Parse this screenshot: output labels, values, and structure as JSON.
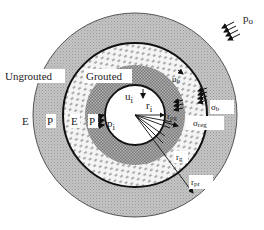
{
  "diagram": {
    "colors": {
      "background": "#ffffff",
      "ungrouted_ring": "#b8b8b8",
      "grouted_zone": "#f2f2f2",
      "plastic_grouted": "#8a8a8a",
      "opening": "#ffffff",
      "line": "#111111"
    },
    "region_labels": {
      "ungrouted": "Ungrouted",
      "grouted": "Grouted"
    },
    "zone_labels": {
      "elastic_outer": "E",
      "plastic_outer": "P",
      "elastic_inner": "E",
      "plastic_inner": "P"
    },
    "symbols": {
      "p_o": "p",
      "p_o_sub": "o",
      "p_i": "p",
      "p_i_sub": "i",
      "u_i": "u",
      "u_i_sub": "i",
      "u_b": "u",
      "u_b_sub": "b",
      "sigma_b": "σ",
      "sigma_b_sub": "b",
      "sigma_reg": "σ",
      "sigma_reg_sub": "reg",
      "r_i": "r",
      "r_i_sub": "i",
      "r_pg": "r",
      "r_pg_sub": "pg",
      "r_g": "r",
      "r_g_sub": "g",
      "r_pr": "r",
      "r_pr_sub": "pr"
    }
  }
}
